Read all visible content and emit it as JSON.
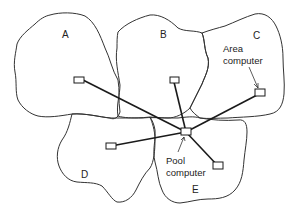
{
  "diagram": {
    "regions": [
      {
        "id": "A",
        "label": "A"
      },
      {
        "id": "B",
        "label": "B"
      },
      {
        "id": "C",
        "label": "C"
      },
      {
        "id": "D",
        "label": "D"
      },
      {
        "id": "E",
        "label": "E"
      }
    ],
    "annotations": {
      "area_computer": {
        "line1": "Area",
        "line2": "computer"
      },
      "pool_computer": {
        "line1": "Pool",
        "line2": "computer"
      }
    },
    "nodes": [
      {
        "id": "area-A"
      },
      {
        "id": "area-B"
      },
      {
        "id": "area-C"
      },
      {
        "id": "area-D"
      },
      {
        "id": "area-E"
      },
      {
        "id": "pool"
      }
    ],
    "edges": [
      {
        "from": "pool",
        "to": "area-A"
      },
      {
        "from": "pool",
        "to": "area-B"
      },
      {
        "from": "pool",
        "to": "area-C"
      },
      {
        "from": "pool",
        "to": "area-D"
      },
      {
        "from": "pool",
        "to": "area-E"
      }
    ]
  }
}
